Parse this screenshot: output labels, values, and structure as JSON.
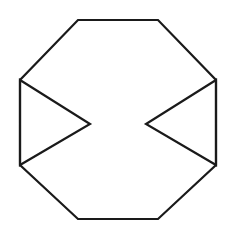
{
  "figure": {
    "canvas": {
      "width": 236,
      "height": 237,
      "background_color": "#ffffff"
    },
    "style": {
      "stroke_color": "#1a1a1a",
      "stroke_width": 2.2,
      "fill": "none"
    },
    "shapes": [
      {
        "name": "octagon",
        "type": "polygon",
        "sides": 8,
        "closed": true,
        "points": "78,20 158,20 216,80 216,165 158,219 78,219 20,165 20,80",
        "vertices": [
          {
            "label": "top-left",
            "x": 78,
            "y": 20
          },
          {
            "label": "top-right",
            "x": 158,
            "y": 20
          },
          {
            "label": "right-top",
            "x": 216,
            "y": 80
          },
          {
            "label": "right-bottom",
            "x": 216,
            "y": 165
          },
          {
            "label": "bottom-right",
            "x": 158,
            "y": 219
          },
          {
            "label": "bottom-left",
            "x": 78,
            "y": 219
          },
          {
            "label": "left-bottom",
            "x": 20,
            "y": 165
          },
          {
            "label": "left-top",
            "x": 20,
            "y": 80
          }
        ]
      },
      {
        "name": "left-triangle",
        "type": "polygon",
        "sides": 3,
        "closed": true,
        "orientation": "apex-pointing-right",
        "points": "20,80 90,124 20,165",
        "vertices": [
          {
            "label": "base-top",
            "x": 20,
            "y": 80
          },
          {
            "label": "apex",
            "x": 90,
            "y": 124
          },
          {
            "label": "base-bottom",
            "x": 20,
            "y": 165
          }
        ]
      },
      {
        "name": "right-triangle",
        "type": "polygon",
        "sides": 3,
        "closed": true,
        "orientation": "apex-pointing-left",
        "points": "216,80 146,124 216,165",
        "vertices": [
          {
            "label": "base-top",
            "x": 216,
            "y": 80
          },
          {
            "label": "apex",
            "x": 146,
            "y": 124
          },
          {
            "label": "base-bottom",
            "x": 216,
            "y": 165
          }
        ]
      }
    ]
  }
}
